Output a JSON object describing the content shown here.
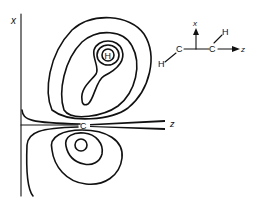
{
  "diagram": {
    "type": "contour-plot-electron-density",
    "axes": {
      "vertical_label": "x",
      "horizontal_label": "z"
    },
    "atom_labels": {
      "carbon": "C",
      "hydrogen": "H"
    },
    "lobes": [
      {
        "name": "upper-lobe",
        "contour_count": 5,
        "centered_on": "H"
      },
      {
        "name": "lower-lobe",
        "contour_count": 3
      }
    ],
    "inset_molecule": {
      "atoms": [
        "H",
        "C",
        "C",
        "H"
      ],
      "axis_x_label": "x",
      "axis_z_label": "z"
    }
  }
}
